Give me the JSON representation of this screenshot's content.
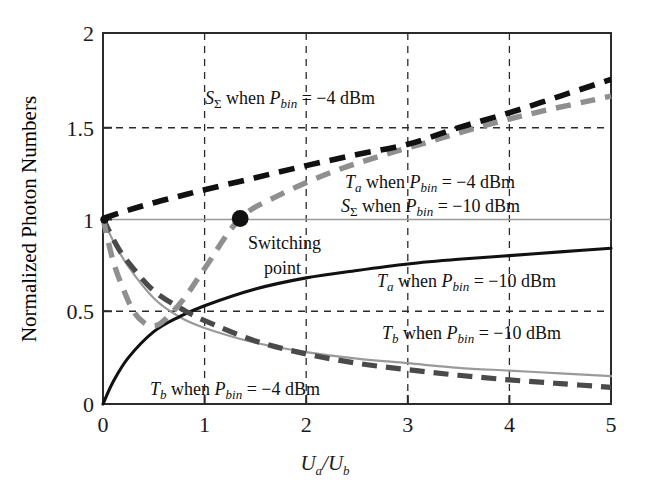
{
  "chart_data": {
    "type": "line",
    "title": "",
    "xlabel": "Ua/Ub",
    "ylabel": "Normalized Photon Numbers",
    "xlim": [
      0,
      5
    ],
    "ylim": [
      0,
      2
    ],
    "xticks": [
      "0",
      "1",
      "2",
      "3",
      "4",
      "5"
    ],
    "yticks": [
      "0",
      "0.5",
      "1",
      "1.5",
      "2"
    ],
    "grid": "dashed-both",
    "legend_position": "inline-annotations",
    "series": [
      {
        "name": "S_Sigma when P_bin = -4 dBm",
        "style": "thick-dashed-black",
        "color": "#111111",
        "x": [
          0,
          0.25,
          0.5,
          0.75,
          1,
          1.5,
          2,
          2.5,
          3,
          3.5,
          4,
          4.5,
          5
        ],
        "y": [
          1.0,
          1.045,
          1.085,
          1.12,
          1.155,
          1.22,
          1.285,
          1.345,
          1.4,
          1.49,
          1.57,
          1.66,
          1.75
        ]
      },
      {
        "name": "T_a when P_bin = -4 dBm / S_Sigma when P_bin = -10 dBm",
        "style": "thick-dashed-gray",
        "color": "#8f8f8f",
        "x": [
          0,
          0.1,
          0.2,
          0.3,
          0.4,
          0.5,
          0.6,
          0.8,
          1.0,
          1.35,
          1.75,
          2.25,
          2.75,
          3.25,
          3.75,
          4.25,
          4.75,
          5
        ],
        "y": [
          1.0,
          0.77,
          0.62,
          0.5,
          0.44,
          0.42,
          0.45,
          0.57,
          0.73,
          1.0,
          1.13,
          1.25,
          1.34,
          1.42,
          1.5,
          1.57,
          1.63,
          1.66
        ]
      },
      {
        "name": "T_a when P_bin = -10 dBm",
        "style": "solid-black",
        "color": "#111111",
        "x": [
          0,
          0.1,
          0.25,
          0.5,
          0.75,
          1,
          1.5,
          2,
          2.5,
          3,
          3.5,
          4,
          4.5,
          5
        ],
        "y": [
          0.0,
          0.12,
          0.25,
          0.39,
          0.47,
          0.53,
          0.62,
          0.68,
          0.72,
          0.755,
          0.78,
          0.8,
          0.82,
          0.84
        ]
      },
      {
        "name": "T_b when P_bin = -10 dBm",
        "style": "solid-gray",
        "color": "#9a9a9a",
        "x": [
          0,
          0.1,
          0.25,
          0.5,
          0.75,
          1,
          1.5,
          2,
          2.5,
          3,
          3.5,
          4,
          4.5,
          5
        ],
        "y": [
          1.0,
          0.88,
          0.74,
          0.57,
          0.47,
          0.41,
          0.33,
          0.28,
          0.245,
          0.22,
          0.195,
          0.18,
          0.165,
          0.15
        ]
      },
      {
        "name": "T_b when P_bin = -4 dBm",
        "style": "thick-dashed-darkgray",
        "color": "#4a4a4a",
        "x": [
          0,
          0.15,
          0.3,
          0.5,
          0.75,
          1,
          1.5,
          2,
          2.5,
          3,
          3.5,
          4,
          4.5,
          5
        ],
        "y": [
          1.0,
          0.84,
          0.73,
          0.61,
          0.52,
          0.45,
          0.34,
          0.27,
          0.22,
          0.185,
          0.155,
          0.13,
          0.11,
          0.09
        ]
      }
    ],
    "markers": [
      {
        "name": "switching-point",
        "x": 1.35,
        "y": 1.0,
        "color": "#111111"
      }
    ],
    "annotations": [
      {
        "id": "ann_s_sigma_m4",
        "text": "S_Σ when P_bin = −4 dBm",
        "x": 1.0,
        "y": 1.67
      },
      {
        "id": "ann_ta_m4",
        "text": "T_a when P_bin = −4 dBm",
        "x": 2.4,
        "y": 1.22
      },
      {
        "id": "ann_s_sigma_m10",
        "text": "S_Σ when P_bin = −10 dBm",
        "x": 2.35,
        "y": 1.09
      },
      {
        "id": "ann_switching",
        "text": "Switching",
        "x": 1.55,
        "y": 0.87
      },
      {
        "id": "ann_switching2",
        "text": "point",
        "x": 1.75,
        "y": 0.74
      },
      {
        "id": "ann_ta_m10",
        "text": "T_a when P_bin = −10 dBm",
        "x": 2.75,
        "y": 0.565
      },
      {
        "id": "ann_tb_m10",
        "text": "T_b when P_bin = −10 dBm",
        "x": 2.8,
        "y": 0.375
      },
      {
        "id": "ann_tb_m4",
        "text": "T_b when P_bin = −4 dBm",
        "x": 0.9,
        "y": 0.085
      }
    ]
  },
  "labels": {
    "y_axis_title": "Normalized Photon Numbers",
    "x_axis_title_num": "U",
    "x_axis_title_sub_a": "a",
    "x_axis_title_slash": "/",
    "x_axis_title_den": "U",
    "x_axis_title_sub_b": "b",
    "yticks": {
      "t0": "0",
      "t1": "0.5",
      "t2": "1",
      "t3": "1.5",
      "t4": "2"
    },
    "xticks": {
      "t0": "0",
      "t1": "1",
      "t2": "2",
      "t3": "3",
      "t4": "4",
      "t5": "5"
    },
    "ann": {
      "s_sigma_main": "S",
      "s_sigma_sub": "Σ",
      "when": " when ",
      "p": "P",
      "p_sub": "bin",
      "eq_m4": " = −4 dBm",
      "eq_m10": " = −10 dBm",
      "t_main": "T",
      "t_sub_a": "a",
      "t_sub_b": "b",
      "switching_l1": "Switching",
      "switching_l2": "point"
    }
  }
}
